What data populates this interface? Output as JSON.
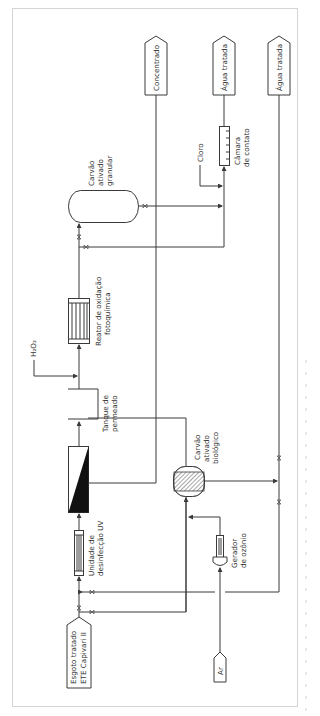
{
  "figure": {
    "orientation": "rotated-90-ccw",
    "caption_visible_but_illegible": true
  },
  "nodes": {
    "source": {
      "label_line1": "Esgoto tratado",
      "label_line2": "ETE Capivari II"
    },
    "uv": {
      "label_line1": "Unidade de",
      "label_line2": "desinfecção UV"
    },
    "tank": {
      "label_line1": "Tanque de",
      "label_line2": "permeado"
    },
    "h2o2": {
      "label": "H₂O₂"
    },
    "reactor": {
      "label_line1": "Reator de oxidação",
      "label_line2": "fotoquímica"
    },
    "gac": {
      "label_line1": "Carvão",
      "label_line2": "ativado",
      "label_line3": "granular"
    },
    "chlorine": {
      "label": "Cloro"
    },
    "contact": {
      "label_line1": "Câmara",
      "label_line2": "de contato"
    },
    "bac": {
      "label_line1": "Carvão",
      "label_line2": "ativado",
      "label_line3": "biológico"
    },
    "ozone": {
      "label_line1": "Gerador",
      "label_line2": "de ozônio"
    },
    "air": {
      "label": "Ar"
    }
  },
  "outputs": [
    {
      "label": "Concentrado"
    },
    {
      "label": "Água tratada"
    },
    {
      "label": "Água tratada"
    }
  ],
  "colors": {
    "line": "#3a3a3a",
    "frame": "#d4d4d4",
    "fill_dark": "#111111"
  }
}
